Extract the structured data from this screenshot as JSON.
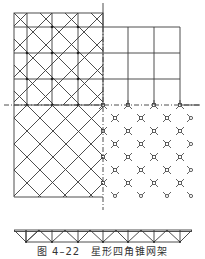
{
  "figure": {
    "caption": "图 4–22　星形四角锥网架",
    "line_color": "#3a3a3a",
    "quadrants": {
      "top_left": "upper-chord diagonal-grid plan with pyramids",
      "top_right": "square orthogonal upper-chord grid",
      "bottom_left": "diagonal lower-chord lattice",
      "bottom_right": "star-shaped node layout"
    },
    "elevation": "truss elevation with 7 bottom nodes"
  }
}
